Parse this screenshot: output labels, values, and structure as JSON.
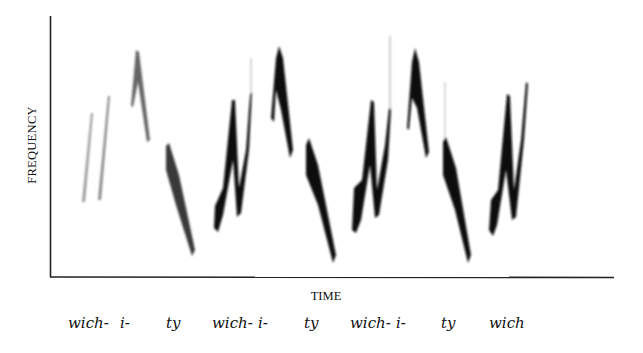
{
  "figure": {
    "y_axis_label": "FREQUENCY",
    "x_axis_label": "TIME",
    "syllables": [
      {
        "text": "wich-",
        "x": 68
      },
      {
        "text": "i-",
        "x": 120
      },
      {
        "text": "ty",
        "x": 166
      },
      {
        "text": "wich-",
        "x": 212
      },
      {
        "text": "i-",
        "x": 258
      },
      {
        "text": "ty",
        "x": 304
      },
      {
        "text": "wich-",
        "x": 350
      },
      {
        "text": "i-",
        "x": 396
      },
      {
        "text": "ty",
        "x": 441
      },
      {
        "text": "wich",
        "x": 489
      }
    ],
    "colors": {
      "ink": "#111111",
      "axis": "#222222",
      "background": "#ffffff"
    }
  }
}
